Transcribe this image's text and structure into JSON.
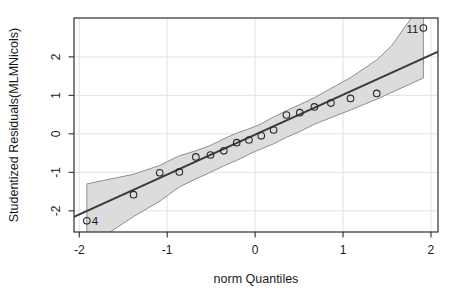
{
  "figure": {
    "width": 457,
    "height": 301,
    "background": "#ffffff"
  },
  "chart_data": {
    "type": "scatter",
    "title": "",
    "xlabel": "norm Quantiles",
    "ylabel": "Studentized Residuals(MLMNicols)",
    "xlim": [
      -2.06,
      2.08
    ],
    "ylim": [
      -2.55,
      3.01
    ],
    "x_ticks": [
      -2,
      -1,
      0,
      1,
      2
    ],
    "x_tick_labels": [
      "-2",
      "-1",
      "0",
      "1",
      "2"
    ],
    "y_ticks": [
      -2,
      -1,
      0,
      1,
      2
    ],
    "y_tick_labels": [
      "-2",
      "-1",
      "0",
      "1",
      "2"
    ],
    "grid": true,
    "legend": "none",
    "points": [
      {
        "x": -1.914,
        "y": -2.26,
        "label": "4",
        "label_side": "right"
      },
      {
        "x": -1.383,
        "y": -1.58
      },
      {
        "x": -1.085,
        "y": -1.01
      },
      {
        "x": -0.862,
        "y": -0.99
      },
      {
        "x": -0.674,
        "y": -0.6
      },
      {
        "x": -0.508,
        "y": -0.55
      },
      {
        "x": -0.356,
        "y": -0.44
      },
      {
        "x": -0.21,
        "y": -0.23
      },
      {
        "x": -0.07,
        "y": -0.16
      },
      {
        "x": 0.07,
        "y": -0.05
      },
      {
        "x": 0.21,
        "y": 0.1
      },
      {
        "x": 0.356,
        "y": 0.49
      },
      {
        "x": 0.508,
        "y": 0.55
      },
      {
        "x": 0.674,
        "y": 0.7
      },
      {
        "x": 0.862,
        "y": 0.8
      },
      {
        "x": 1.085,
        "y": 0.92
      },
      {
        "x": 1.383,
        "y": 1.05
      },
      {
        "x": 1.914,
        "y": 2.75,
        "label": "11",
        "label_side": "left"
      }
    ],
    "reference_line": {
      "slope": 1.036,
      "intercept": -0.02
    },
    "confidence_band": {
      "upper": [
        [
          -1.914,
          -1.3
        ],
        [
          -1.383,
          -1.05
        ],
        [
          -1.085,
          -0.82
        ],
        [
          -0.862,
          -0.57
        ],
        [
          -0.674,
          -0.44
        ],
        [
          -0.508,
          -0.3
        ],
        [
          -0.356,
          -0.13
        ],
        [
          -0.21,
          0.02
        ],
        [
          -0.07,
          0.13
        ],
        [
          0.07,
          0.26
        ],
        [
          0.21,
          0.44
        ],
        [
          0.356,
          0.6
        ],
        [
          0.508,
          0.76
        ],
        [
          0.674,
          0.94
        ],
        [
          0.862,
          1.18
        ],
        [
          1.085,
          1.46
        ],
        [
          1.383,
          1.92
        ],
        [
          1.55,
          2.28
        ],
        [
          1.914,
          3.45
        ]
      ],
      "lower": [
        [
          -1.914,
          -2.95
        ],
        [
          -1.383,
          -2.15
        ],
        [
          -1.085,
          -1.75
        ],
        [
          -0.862,
          -1.38
        ],
        [
          -0.674,
          -1.17
        ],
        [
          -0.508,
          -1.0
        ],
        [
          -0.356,
          -0.83
        ],
        [
          -0.21,
          -0.69
        ],
        [
          -0.07,
          -0.53
        ],
        [
          0.07,
          -0.39
        ],
        [
          0.21,
          -0.26
        ],
        [
          0.356,
          -0.09
        ],
        [
          0.508,
          0.06
        ],
        [
          0.674,
          0.25
        ],
        [
          0.862,
          0.42
        ],
        [
          1.085,
          0.62
        ],
        [
          1.383,
          0.9
        ],
        [
          1.914,
          1.45
        ]
      ]
    },
    "colors": {
      "band_fill": "#dcdcdc",
      "band_stroke": "#8f8f8f",
      "line": "#3c3c3c",
      "point_stroke": "#2b2b2b",
      "axis": "#2d2d2d",
      "grid": "#e2e2e2",
      "text": "#1a1a1a"
    }
  }
}
